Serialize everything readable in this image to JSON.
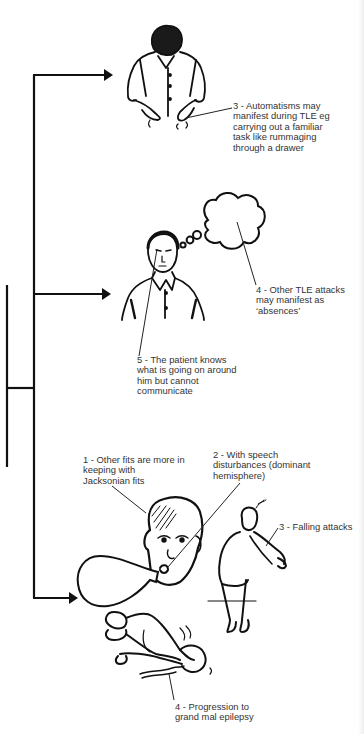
{
  "diagram": {
    "branches": [
      {
        "id": "automatisms",
        "figure": "man-looking-down-hands-moving",
        "labels": [
          {
            "id": "automatisms-label",
            "lines": [
              "3 - Automatisms may",
              "manifest during TLE eg",
              "carrying out a familiar",
              "task like rummaging",
              "through a drawer"
            ]
          }
        ]
      },
      {
        "id": "absences",
        "figure": "man-with-thought-bubble",
        "labels": [
          {
            "id": "absences-label",
            "lines": [
              "4 - Other TLE attacks",
              "may manifest as",
              "‘absences’"
            ]
          },
          {
            "id": "awareness-label",
            "lines": [
              "5 - The patient knows",
              "what is going on around",
              "him but cannot",
              "communicate"
            ]
          }
        ]
      },
      {
        "id": "other-fits",
        "figure": "head-with-speech-bubble-falling-man-lying-man",
        "labels": [
          {
            "id": "jacksonian-label",
            "lines": [
              "1 - Other fits are more in",
              "keeping with",
              "Jacksonian fits"
            ]
          },
          {
            "id": "speech-label",
            "lines": [
              "2 - With speech",
              "disturbances (dominant",
              "hemisphere)"
            ]
          },
          {
            "id": "falling-label",
            "lines": [
              "3 - Falling attacks"
            ]
          },
          {
            "id": "grand-mal-label",
            "lines": [
              "4 - Progression to",
              "grand mal epilepsy"
            ]
          }
        ]
      }
    ],
    "colors": {
      "line": "#111111",
      "text": "#333333",
      "background": "#ffffff"
    }
  }
}
